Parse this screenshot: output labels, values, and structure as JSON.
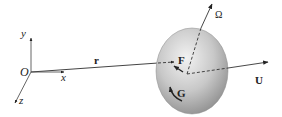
{
  "diagram": {
    "type": "rigid body in fluid frame",
    "labels": {
      "origin": "O",
      "x_axis": "x",
      "y_axis": "y",
      "z_axis": "z",
      "position_vector": "r",
      "angular_velocity": "Ω",
      "velocity": "U",
      "force": "F",
      "torque": "G"
    },
    "colors": {
      "line": "#333333",
      "body_fill_light": "#ececec",
      "body_fill_dark": "#9a9a9a",
      "text": "#222222"
    }
  }
}
